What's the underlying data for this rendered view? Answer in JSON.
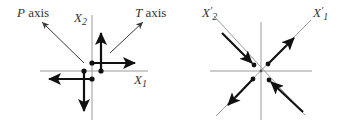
{
  "colors": {
    "axis_line": "#9a9a9a",
    "thin_arrow": "#3a3a3a",
    "force_arrow": "#111111",
    "label": "#333333",
    "background": "#ffffff"
  },
  "left_diagram": {
    "p_axis": {
      "letter": "P",
      "suffix": " axis"
    },
    "t_axis": {
      "letter": "T",
      "suffix": " axis"
    },
    "x2_label": {
      "letter": "X",
      "sub": "2"
    },
    "x1_label": {
      "letter": "X",
      "sub": "1"
    },
    "description": "Double-couple force system with two opposing couples about the origin; P axis to upper-left, T axis to upper-right"
  },
  "right_diagram": {
    "x2p_label": {
      "letter": "X",
      "prime": "′",
      "sub": "2"
    },
    "x1p_label": {
      "letter": "X",
      "prime": "′",
      "sub": "1"
    },
    "description": "Equivalent force system rotated 45°: compression along X'2 (arrows pointing inward), tension along X'1 (arrows pointing outward)"
  }
}
